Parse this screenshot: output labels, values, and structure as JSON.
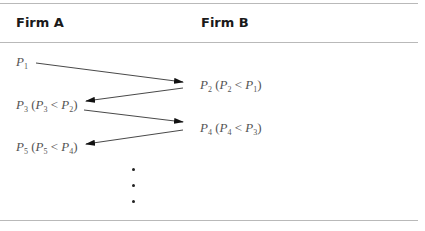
{
  "header": {
    "col_a": "Firm A",
    "col_b": "Firm B"
  },
  "rows": [
    {
      "firm": "A",
      "symbol": "P",
      "sub": "1",
      "condition": null
    },
    {
      "firm": "B",
      "symbol": "P",
      "sub": "2",
      "condition": {
        "lhs_sub": "2",
        "op": "<",
        "rhs_sub": "1"
      }
    },
    {
      "firm": "A",
      "symbol": "P",
      "sub": "3",
      "condition": {
        "lhs_sub": "3",
        "op": "<",
        "rhs_sub": "2"
      }
    },
    {
      "firm": "B",
      "symbol": "P",
      "sub": "4",
      "condition": {
        "lhs_sub": "4",
        "op": "<",
        "rhs_sub": "3"
      }
    },
    {
      "firm": "A",
      "symbol": "P",
      "sub": "5",
      "condition": {
        "lhs_sub": "5",
        "op": "<",
        "rhs_sub": "4"
      }
    }
  ],
  "labels": {
    "p1": "P",
    "p1_sub": "1",
    "p2": "P",
    "p2_sub": "2",
    "p2_cond_open": " (",
    "p2_cond_l": "P",
    "p2_cond_l_sub": "2",
    "p2_cond_op": " < ",
    "p2_cond_r": "P",
    "p2_cond_r_sub": "1",
    "p2_cond_close": ")",
    "p3": "P",
    "p3_sub": "3",
    "p3_cond_open": " (",
    "p3_cond_l": "P",
    "p3_cond_l_sub": "3",
    "p3_cond_op": " < ",
    "p3_cond_r": "P",
    "p3_cond_r_sub": "2",
    "p3_cond_close": ")",
    "p4": "P",
    "p4_sub": "4",
    "p4_cond_open": " (",
    "p4_cond_l": "P",
    "p4_cond_l_sub": "4",
    "p4_cond_op": " < ",
    "p4_cond_r": "P",
    "p4_cond_r_sub": "3",
    "p4_cond_close": ")",
    "p5": "P",
    "p5_sub": "5",
    "p5_cond_open": " (",
    "p5_cond_l": "P",
    "p5_cond_l_sub": "5",
    "p5_cond_op": " < ",
    "p5_cond_r": "P",
    "p5_cond_r_sub": "4",
    "p5_cond_close": ")"
  },
  "continuation": "vertical ellipsis (3 dots)"
}
